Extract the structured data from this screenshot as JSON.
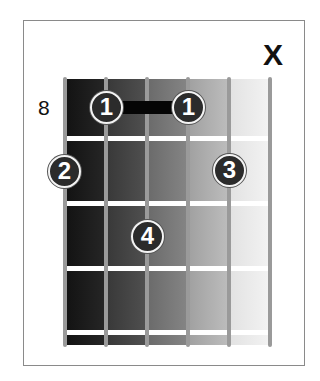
{
  "diagram": {
    "type": "guitar-chord-chart",
    "starting_fret_label": "8",
    "string_markers": [
      {
        "string": 6,
        "marker": "X",
        "meaning": "muted"
      }
    ],
    "barre": {
      "finger": "1",
      "from_string": 2,
      "to_string": 4,
      "fret_row": 1
    },
    "fingers": [
      {
        "label": "1",
        "string": 2,
        "fret_row": 1
      },
      {
        "label": "1",
        "string": 4,
        "fret_row": 1
      },
      {
        "label": "2",
        "string": 1,
        "fret_row": 2
      },
      {
        "label": "3",
        "string": 5,
        "fret_row": 2
      },
      {
        "label": "4",
        "string": 3,
        "fret_row": 3
      }
    ],
    "num_strings": 6,
    "num_fret_rows": 4,
    "colors": {
      "string": "#9a9a9a",
      "fret": "#ffffff",
      "finger_fill": "#2b2b2b",
      "finger_ring": "#f4f4f4",
      "barre": "#050505",
      "board_dark": "#141414",
      "board_light": "#f2f2f2"
    }
  }
}
